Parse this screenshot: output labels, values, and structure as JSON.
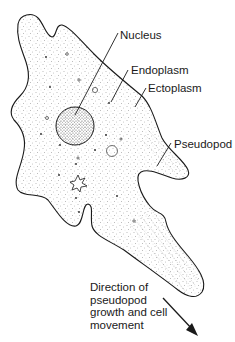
{
  "diagram": {
    "colors": {
      "outline": "#1a1a1a",
      "stipple": "#6a6a6a",
      "nucleus_fill": "#d8d8d8",
      "background": "#ffffff"
    },
    "labels": {
      "nucleus": "Nucleus",
      "endoplasm": "Endoplasm",
      "ectoplasm": "Ectoplasm",
      "pseudopod": "Pseudopod"
    },
    "caption": {
      "line1": "Direction of",
      "line2": "pseudopod",
      "line3": "growth and cell",
      "line4": "movement"
    }
  }
}
